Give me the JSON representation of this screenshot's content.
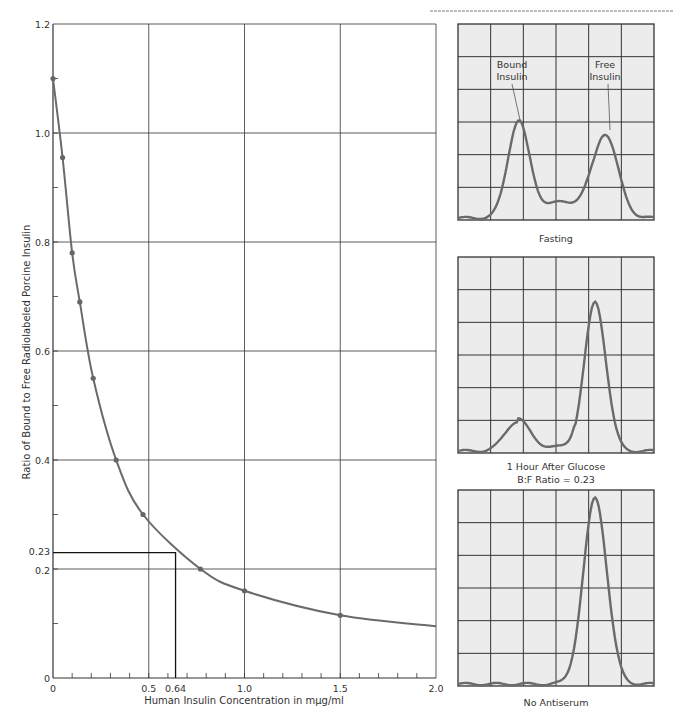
{
  "header": {
    "running_head": "RADIOIMMUNOASSAY OF INSULIN"
  },
  "chart_data": [
    {
      "type": "line",
      "title": "",
      "xlabel": "Human Insulin Concentration in mμg/ml",
      "ylabel": "Ratio of Bound to Free Radiolabeled Porcine Insulin",
      "xlim": [
        0,
        2.0
      ],
      "ylim": [
        0,
        1.2
      ],
      "grid": true,
      "x_ticks": [
        {
          "value": 0,
          "label": "0"
        },
        {
          "value": 0.5,
          "label": "0.5"
        },
        {
          "value": 0.64,
          "label": "0.64"
        },
        {
          "value": 1.0,
          "label": "1.0"
        },
        {
          "value": 1.5,
          "label": "1.5"
        },
        {
          "value": 2.0,
          "label": "2.0"
        }
      ],
      "y_ticks": [
        {
          "value": 0,
          "label": "0"
        },
        {
          "value": 0.2,
          "label": "0.2"
        },
        {
          "value": 0.23,
          "label": "0.23"
        },
        {
          "value": 0.4,
          "label": "0.4"
        },
        {
          "value": 0.6,
          "label": "0.6"
        },
        {
          "value": 0.8,
          "label": "0.8"
        },
        {
          "value": 1.0,
          "label": "1.0"
        },
        {
          "value": 1.2,
          "label": "1.2"
        }
      ],
      "x_gridlines": [
        0.5,
        1.0,
        1.5,
        2.0
      ],
      "y_gridlines": [
        0.2,
        0.4,
        0.6,
        0.8,
        1.0,
        1.2
      ],
      "x_minor_step": 0.1,
      "y_minor_step": 0.1,
      "series": [
        {
          "name": "Standard curve",
          "x": [
            0,
            0.05,
            0.1,
            0.14,
            0.21,
            0.33,
            0.47,
            0.77,
            1.0,
            1.5
          ],
          "y": [
            1.1,
            0.955,
            0.78,
            0.69,
            0.55,
            0.4,
            0.3,
            0.2,
            0.16,
            0.115
          ]
        }
      ],
      "curve_end": {
        "x": 2.0,
        "y": 0.095
      },
      "annotation": {
        "x": 0.64,
        "y": 0.23,
        "description": "Reading for B:F ratio 0.23 gives 0.64 mμg/ml"
      }
    },
    {
      "type": "line",
      "title": "Fasting",
      "panel": "electrophoresis-strip",
      "labels": [
        "Bound Insulin",
        "Free Insulin"
      ],
      "peaks": [
        {
          "name": "Bound Insulin",
          "position": 0.31,
          "height": 0.5
        },
        {
          "name": "Free Insulin",
          "position": 0.75,
          "height": 0.43
        }
      ],
      "grid": {
        "cols": 6,
        "rows": 6
      }
    },
    {
      "type": "line",
      "title": "1 Hour After Glucose",
      "subtitle": "B:F Ratio = 0.23",
      "peaks": [
        {
          "name": "Bound",
          "position": 0.3,
          "height": 0.15
        },
        {
          "name": "Free",
          "position": 0.7,
          "height": 0.76
        }
      ],
      "grid": {
        "cols": 6,
        "rows": 6
      }
    },
    {
      "type": "line",
      "title": "No Antiserum",
      "peaks": [
        {
          "name": "Free",
          "position": 0.7,
          "height": 0.95
        }
      ],
      "grid": {
        "cols": 6,
        "rows": 6
      }
    }
  ],
  "colors": {
    "curve": "#6a6a6a",
    "grid": "#333333",
    "panel_bg": "#ececec",
    "trace": "#6a6a6a"
  }
}
